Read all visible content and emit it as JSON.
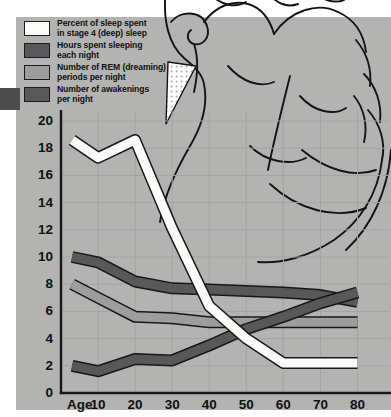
{
  "figure": {
    "background_color": "#b3b4b2",
    "plot_background_color": "#b4b5b3",
    "grid_color": "#a3a4a2",
    "axis_color": "#16181a"
  },
  "legend": {
    "position": "top-left",
    "items": [
      {
        "label": "Percent of sleep spent\nin stage 4 (deep) sleep",
        "color": "#fbfbf7",
        "border": "#1b1b1b",
        "series_key": "stage4_percent"
      },
      {
        "label": "Hours spent sleeping\neach night",
        "color": "#56585a",
        "border": "#1b1b1b",
        "series_key": "hours_sleeping"
      },
      {
        "label": "Number of REM (dreaming)\nperiods per night",
        "color": "#9d9e9c",
        "border": "#1b1b1b",
        "series_key": "rem_periods"
      },
      {
        "label": "Number of awakenings\nper night",
        "color": "#56585a",
        "border": "#1b1b1b",
        "series_key": "awakenings"
      }
    ]
  },
  "axes": {
    "x_prefix_label": "Age",
    "x_ticks": [
      "10",
      "20",
      "30",
      "40",
      "50",
      "60",
      "70",
      "80"
    ],
    "y_ticks": [
      "0",
      "2",
      "4",
      "6",
      "8",
      "10",
      "12",
      "14",
      "16",
      "18",
      "20"
    ]
  },
  "chart_data": {
    "type": "line",
    "title": "",
    "subtitle": "",
    "xlabel": "Age",
    "ylabel": "",
    "xlim": [
      0,
      85
    ],
    "ylim": [
      0,
      20
    ],
    "grid": true,
    "legend_position": "top-left",
    "x": [
      3,
      10,
      20,
      30,
      40,
      50,
      60,
      70,
      80
    ],
    "x_tick_values": [
      10,
      20,
      30,
      40,
      50,
      60,
      70,
      80
    ],
    "y_tick_values": [
      0,
      2,
      4,
      6,
      8,
      10,
      12,
      14,
      16,
      18,
      20
    ],
    "series": [
      {
        "name": "Percent of sleep spent in stage 4 (deep) sleep",
        "key": "stage4_percent",
        "color": "#fbfbf7",
        "outline": "#16181a",
        "values": [
          18.6,
          17.3,
          18.6,
          12.1,
          6.4,
          4.0,
          2.2,
          2.2,
          2.2
        ]
      },
      {
        "name": "Hours spent sleeping each night",
        "key": "hours_sleeping",
        "color": "#56585a",
        "outline": "#16181a",
        "values": [
          10.0,
          9.6,
          8.2,
          7.7,
          7.6,
          7.5,
          7.4,
          7.2,
          6.7
        ]
      },
      {
        "name": "Number of REM (dreaming) periods per night",
        "key": "rem_periods",
        "color": "#9d9e9c",
        "outline": "#16181a",
        "values": [
          8.0,
          7.0,
          5.6,
          5.5,
          5.2,
          5.2,
          5.2,
          5.2,
          5.2
        ]
      },
      {
        "name": "Number of awakenings per night",
        "key": "awakenings",
        "color": "#56585a",
        "outline": "#16181a",
        "values": [
          2.0,
          1.6,
          2.5,
          2.4,
          3.5,
          4.7,
          5.6,
          6.6,
          7.4
        ]
      }
    ],
    "annotations": [
      "Background line-art illustration of a sleeping person's head"
    ]
  }
}
